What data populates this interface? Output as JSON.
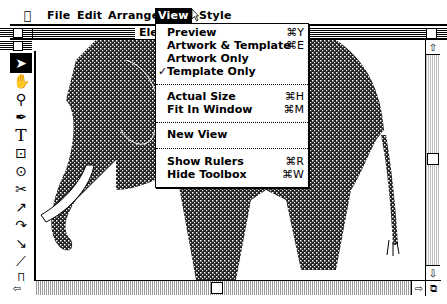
{
  "menubar": {
    "apple": "",
    "items": [
      {
        "label": "File",
        "active": false
      },
      {
        "label": "Edit",
        "active": false
      },
      {
        "label": "Arrange",
        "active": false
      },
      {
        "label": "View",
        "active": true
      },
      {
        "label": "Style",
        "active": false
      }
    ]
  },
  "window": {
    "title": "Elephant"
  },
  "view_menu": {
    "groups": [
      [
        {
          "label": "Preview",
          "shortcut": "⌘Y",
          "checked": false
        },
        {
          "label": "Artwork & Template",
          "shortcut": "⌘E",
          "checked": false
        },
        {
          "label": "Artwork Only",
          "shortcut": "",
          "checked": false
        },
        {
          "label": "Template Only",
          "shortcut": "",
          "checked": true
        }
      ],
      [
        {
          "label": "Actual Size",
          "shortcut": "⌘H",
          "checked": false
        },
        {
          "label": "Fit In Window",
          "shortcut": "⌘M",
          "checked": false
        }
      ],
      [
        {
          "label": "New View",
          "shortcut": "",
          "checked": false
        }
      ],
      [
        {
          "label": "Show Rulers",
          "shortcut": "⌘R",
          "checked": false
        },
        {
          "label": "Hide Toolbox",
          "shortcut": "⌘W",
          "checked": false
        }
      ]
    ],
    "check_glyph": "✓"
  },
  "toolbox": {
    "tools": [
      {
        "name": "selection-arrow",
        "glyph": "➤",
        "selected": true
      },
      {
        "name": "grabber-hand",
        "glyph": "✋",
        "selected": false
      },
      {
        "name": "zoom",
        "glyph": "⚲",
        "selected": false
      },
      {
        "name": "pen",
        "glyph": "✒",
        "selected": false
      },
      {
        "name": "text",
        "glyph": "T",
        "selected": false
      },
      {
        "name": "rectangle",
        "glyph": "⊡",
        "selected": false
      },
      {
        "name": "oval",
        "glyph": "⊙",
        "selected": false
      },
      {
        "name": "scissors",
        "glyph": "✂",
        "selected": false
      },
      {
        "name": "freehand-corner",
        "glyph": "↗",
        "selected": false
      },
      {
        "name": "curve",
        "glyph": "↷",
        "selected": false
      },
      {
        "name": "reflect",
        "glyph": "↘",
        "selected": false
      },
      {
        "name": "shear",
        "glyph": "⟋",
        "selected": false
      },
      {
        "name": "page",
        "glyph": "▯",
        "selected": false
      }
    ]
  },
  "canvas": {
    "subject": "Elephant template artwork"
  },
  "scrollbars": {
    "up": "⇧",
    "down": "⇩",
    "left": "⇦",
    "right": "⇨",
    "grow": "⧉"
  }
}
